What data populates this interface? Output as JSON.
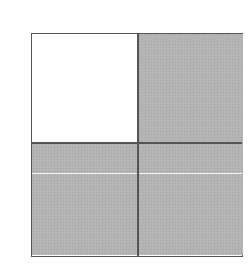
{
  "figure": {
    "title": "Four-quadrant square diagram",
    "background_color": "#ffffff",
    "border_color": "#555555",
    "gray_fill_color": "#b2b2b2",
    "white_fill_color": "#ffffff",
    "highlight_line_color": "#ffffff",
    "square": {
      "left": 31,
      "top": 33,
      "width": 212,
      "height": 224,
      "border_width": 1.6
    },
    "dividers": {
      "vertical_x": 138,
      "horizontal_y": 143,
      "divider_color": "#555555"
    },
    "highlight_line": {
      "y": 174,
      "color": "#ffffff",
      "label": "faint white horizontal scan line across lower half"
    },
    "quadrants": [
      {
        "id": "top-left",
        "label": "Top left quadrant",
        "fill": "white",
        "row": 1,
        "col": 1
      },
      {
        "id": "top-right",
        "label": "Top right quadrant",
        "fill": "gray",
        "row": 1,
        "col": 2
      },
      {
        "id": "bottom-left",
        "label": "Bottom left quadrant",
        "fill": "gray",
        "row": 2,
        "col": 1
      },
      {
        "id": "bottom-right",
        "label": "Bottom right quadrant",
        "fill": "gray",
        "row": 2,
        "col": 2
      }
    ]
  }
}
